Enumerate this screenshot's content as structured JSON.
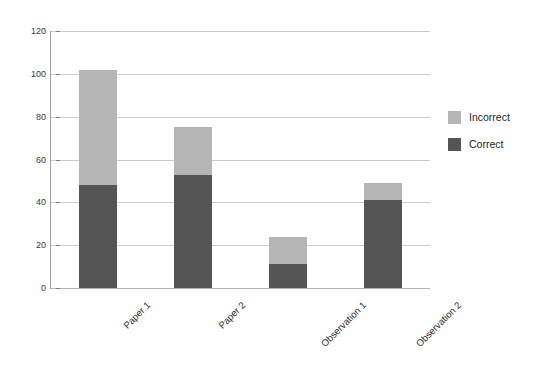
{
  "chart_data": {
    "type": "bar",
    "subtype": "stacked-vertical",
    "title": "",
    "xlabel": "",
    "ylabel": "",
    "categories": [
      "Paper 1",
      "Paper 2",
      "Observation 1",
      "Observation 2"
    ],
    "series": [
      {
        "name": "Correct",
        "values": [
          48,
          53,
          11,
          41
        ],
        "color": "#555555"
      },
      {
        "name": "Incorrect",
        "values": [
          54,
          22,
          13,
          8
        ],
        "color": "#b5b5b5"
      }
    ],
    "totals": [
      102,
      75,
      24,
      49
    ],
    "ylim": [
      0,
      120
    ],
    "yticks": [
      0,
      20,
      40,
      60,
      80,
      100,
      120
    ],
    "ytick_labels": [
      "0",
      "20",
      "40",
      "60",
      "80",
      "100",
      "120"
    ],
    "grid": true,
    "legend_position": "right",
    "legend_entries": [
      {
        "label": "Incorrect",
        "color": "#b5b5b5"
      },
      {
        "label": "Correct",
        "color": "#555555"
      }
    ],
    "xtick_rotation": -45,
    "background": "#ffffff",
    "gridline_color": "#c9cdd2",
    "axis_color": "#9aa0a6"
  }
}
